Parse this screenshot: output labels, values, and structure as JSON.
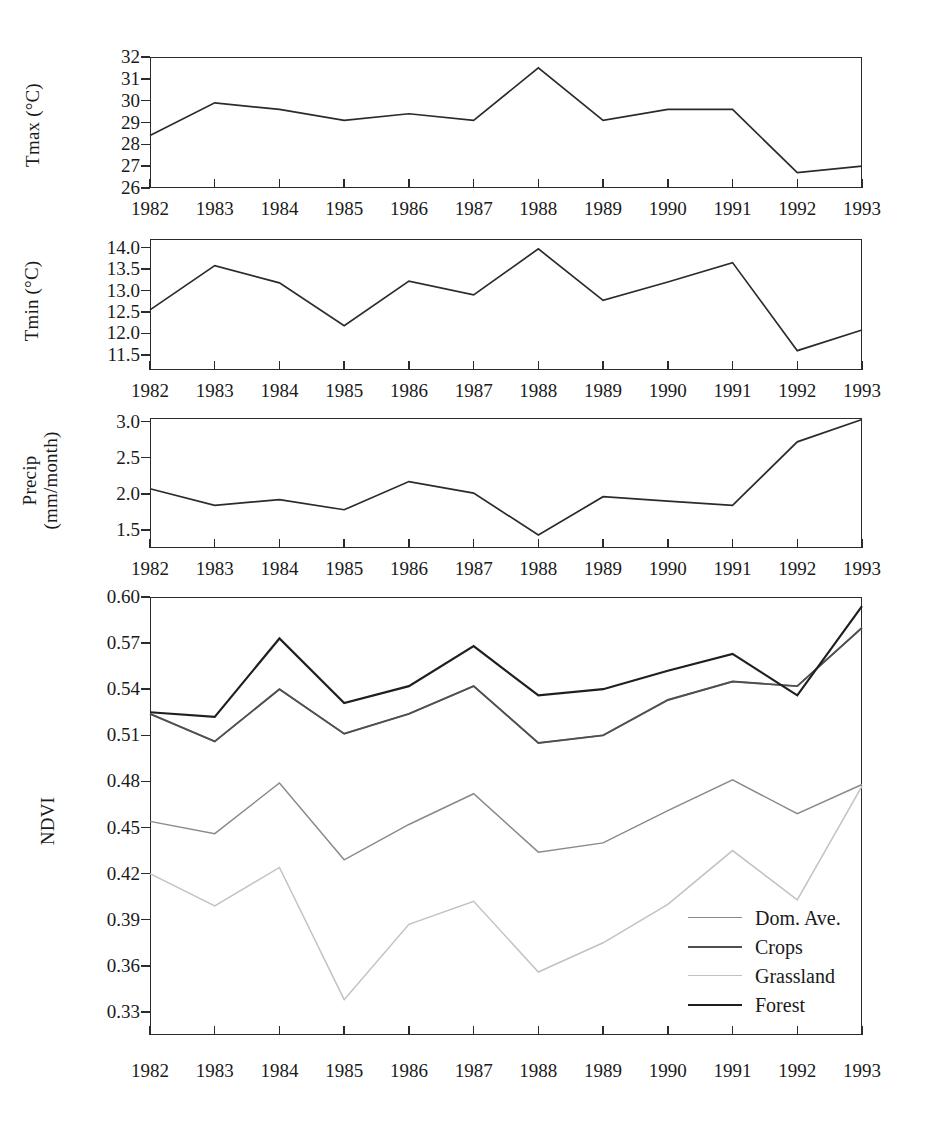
{
  "figure": {
    "x_categories": [
      "1982",
      "1983",
      "1984",
      "1985",
      "1986",
      "1987",
      "1988",
      "1989",
      "1990",
      "1991",
      "1992",
      "1993"
    ],
    "colors": {
      "axis": "#2b2b2b",
      "dom_ave": "#8a8a8a",
      "crops": "#4f4f4f",
      "grassland": "#c2c2c2",
      "forest": "#1f1f1f"
    }
  },
  "panels": {
    "tmax": {
      "ylabel": "Tmax (°C)",
      "yticks": [
        "32",
        "31",
        "30",
        "29",
        "28",
        "27",
        "26"
      ],
      "xticks": [
        "1982",
        "1983",
        "1984",
        "1985",
        "1986",
        "1987",
        "1988",
        "1989",
        "1990",
        "1991",
        "1992",
        "1993"
      ]
    },
    "tmin": {
      "ylabel": "Tmin (°C)",
      "yticks": [
        "14.0",
        "13.5",
        "13.0",
        "12.5",
        "12.0",
        "11.5"
      ],
      "xticks": [
        "1982",
        "1983",
        "1984",
        "1985",
        "1986",
        "1987",
        "1988",
        "1989",
        "1990",
        "1991",
        "1992",
        "1993"
      ]
    },
    "precip": {
      "ylabel_line1": "Precip",
      "ylabel_line2": "(mm/month)",
      "yticks": [
        "3.0",
        "2.5",
        "2.0",
        "1.5"
      ],
      "xticks": [
        "1982",
        "1983",
        "1984",
        "1985",
        "1986",
        "1987",
        "1988",
        "1989",
        "1990",
        "1991",
        "1992",
        "1993"
      ]
    },
    "ndvi": {
      "ylabel": "NDVI",
      "yticks": [
        "0.60",
        "0.57",
        "0.54",
        "0.51",
        "0.48",
        "0.45",
        "0.42",
        "0.39",
        "0.36",
        "0.33"
      ],
      "xticks": [
        "1982",
        "1983",
        "1984",
        "1985",
        "1986",
        "1987",
        "1988",
        "1989",
        "1990",
        "1991",
        "1992",
        "1993"
      ],
      "legend": [
        {
          "label": "Dom. Ave.",
          "color": "#8a8a8a",
          "width": 1.6
        },
        {
          "label": "Crops",
          "color": "#4f4f4f",
          "width": 2.0
        },
        {
          "label": "Grassland",
          "color": "#c2c2c2",
          "width": 1.6
        },
        {
          "label": "Forest",
          "color": "#1f1f1f",
          "width": 2.4
        }
      ]
    }
  },
  "chart_data": [
    {
      "type": "line",
      "title": "Tmax",
      "xlabel": "",
      "ylabel": "Tmax (°C)",
      "x": [
        1982,
        1983,
        1984,
        1985,
        1986,
        1987,
        1988,
        1989,
        1990,
        1991,
        1992,
        1993
      ],
      "values": [
        28.4,
        29.9,
        29.6,
        29.1,
        29.4,
        29.1,
        31.5,
        29.1,
        29.6,
        29.6,
        26.7,
        27.0
      ],
      "ylim": [
        26,
        32
      ],
      "yticks": [
        26,
        27,
        28,
        29,
        30,
        31,
        32
      ],
      "grid": false
    },
    {
      "type": "line",
      "title": "Tmin",
      "xlabel": "",
      "ylabel": "Tmin (°C)",
      "x": [
        1982,
        1983,
        1984,
        1985,
        1986,
        1987,
        1988,
        1989,
        1990,
        1991,
        1992,
        1993
      ],
      "values": [
        12.55,
        13.58,
        13.18,
        12.18,
        13.22,
        12.9,
        13.97,
        12.77,
        13.2,
        13.65,
        11.6,
        12.08
      ],
      "ylim": [
        11.15,
        14.2
      ],
      "yticks": [
        11.5,
        12.0,
        12.5,
        13.0,
        13.5,
        14.0
      ],
      "grid": false
    },
    {
      "type": "line",
      "title": "Precip",
      "xlabel": "",
      "ylabel": "Precip (mm/month)",
      "x": [
        1982,
        1983,
        1984,
        1985,
        1986,
        1987,
        1988,
        1989,
        1990,
        1991,
        1992,
        1993
      ],
      "values": [
        2.07,
        1.84,
        1.92,
        1.78,
        2.17,
        2.01,
        1.43,
        1.96,
        1.9,
        1.84,
        2.72,
        3.03
      ],
      "ylim": [
        1.25,
        3.05
      ],
      "yticks": [
        1.5,
        2.0,
        2.5,
        3.0
      ],
      "grid": false
    },
    {
      "type": "line",
      "title": "NDVI",
      "xlabel": "",
      "ylabel": "NDVI",
      "x": [
        1982,
        1983,
        1984,
        1985,
        1986,
        1987,
        1988,
        1989,
        1990,
        1991,
        1992,
        1993
      ],
      "ylim": [
        0.315,
        0.6
      ],
      "yticks": [
        0.33,
        0.36,
        0.39,
        0.42,
        0.45,
        0.48,
        0.51,
        0.54,
        0.57,
        0.6
      ],
      "grid": false,
      "legend_position": "lower-right",
      "series": [
        {
          "name": "Dom. Ave.",
          "color": "#8a8a8a",
          "values": [
            0.524,
            0.506,
            0.54,
            0.511,
            0.524,
            0.542,
            0.505,
            0.51,
            0.533,
            0.545,
            0.542,
            0.58
          ]
        },
        {
          "name": "Crops",
          "color": "#4f4f4f",
          "values": [
            0.524,
            0.506,
            0.54,
            0.511,
            0.524,
            0.542,
            0.505,
            0.51,
            0.533,
            0.545,
            0.542,
            0.58
          ]
        },
        {
          "name": "Grassland",
          "color": "#c2c2c2",
          "values": [
            0.42,
            0.399,
            0.424,
            0.338,
            0.387,
            0.402,
            0.356,
            0.375,
            0.4,
            0.435,
            0.403,
            0.477
          ]
        },
        {
          "name": "Forest",
          "color": "#1f1f1f",
          "values": [
            0.525,
            0.522,
            0.573,
            0.531,
            0.542,
            0.568,
            0.536,
            0.54,
            0.552,
            0.563,
            0.536,
            0.594
          ]
        },
        {
          "name": "Dom. Ave. (mid band)",
          "color": "#8a8a8a",
          "values": [
            0.454,
            0.446,
            0.479,
            0.429,
            0.452,
            0.472,
            0.434,
            0.44,
            0.461,
            0.481,
            0.459,
            0.478
          ]
        }
      ]
    }
  ]
}
